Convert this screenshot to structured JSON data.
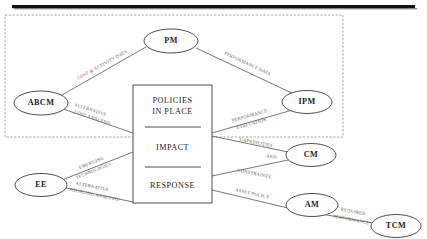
{
  "figure": {
    "type": "block-flow-diagram",
    "top_rule": {
      "present": true,
      "color": "#121212"
    },
    "boundary": {
      "name": "dashed-boundary-region",
      "style": "dashed",
      "color": "#8a8a8a",
      "x": 5,
      "y": 15,
      "width": 338,
      "height": 122
    }
  },
  "center_box": {
    "name": "policies-impact-response-box",
    "x": 133,
    "y": 85,
    "width": 79,
    "height": 118,
    "sections": [
      {
        "label": "POLICIES",
        "label2": "IN PLACE"
      },
      {
        "label": "IMPACT"
      },
      {
        "label": "RESPONSE"
      }
    ],
    "line1": "POLICIES",
    "line2": "IN PLACE",
    "line3": "IMPACT",
    "line4": "RESPONSE"
  },
  "nodes": [
    {
      "id": "PM",
      "label": "PM",
      "cx": 171,
      "cy": 41,
      "rx": 27,
      "ry": 12
    },
    {
      "id": "ABCM",
      "label": "ABCM",
      "cx": 41,
      "cy": 103,
      "rx": 27,
      "ry": 12
    },
    {
      "id": "IPM",
      "label": "IPM",
      "cx": 307,
      "cy": 102,
      "rx": 25,
      "ry": 11.5
    },
    {
      "id": "CM",
      "label": "CM",
      "cx": 311,
      "cy": 155,
      "rx": 25,
      "ry": 11.5
    },
    {
      "id": "EE",
      "label": "EE",
      "cx": 41,
      "cy": 185,
      "rx": 26,
      "ry": 11.5
    },
    {
      "id": "AM",
      "label": "AM",
      "cx": 312,
      "cy": 205,
      "rx": 26,
      "ry": 11.5
    },
    {
      "id": "TCM",
      "label": "TCM",
      "cx": 396,
      "cy": 226,
      "rx": 25,
      "ry": 11.5
    }
  ],
  "edges": [
    {
      "id": "abcm-pm",
      "from": "ABCM",
      "to": "PM",
      "label": "COST & ACTIVITY DATA",
      "label_x": 103,
      "label_y": 66,
      "label_rotate": -27
    },
    {
      "id": "pm-ipm",
      "from": "PM",
      "to": "IPM",
      "label": "PERFORMANCE DATA",
      "label_x": 247,
      "label_y": 65,
      "label_rotate": 31
    },
    {
      "id": "abcm-box",
      "from": "ABCM",
      "to": "center_box",
      "label_line1": "ALTERNATIVE",
      "label_line2": "COST ANALYSIS",
      "label_x": 88,
      "label_y": 112,
      "label_rotate": 13
    },
    {
      "id": "ipm-box",
      "from": "IPM",
      "to": "center_box",
      "label_line1": "PERFORMANCE",
      "label_line2": "EVALUATION",
      "label_x": 252,
      "label_y": 115,
      "label_rotate": -31
    },
    {
      "id": "box-cm",
      "from": "center_box",
      "to": "CM",
      "label": "CAPABILITIES",
      "label_x": 255,
      "label_y": 144,
      "label_rotate": -11
    },
    {
      "id": "box-cm-and",
      "label": "AND",
      "label_x": 268,
      "label_y": 158,
      "label_rotate": -11
    },
    {
      "id": "cm-box",
      "from": "CM",
      "to": "center_box",
      "label": "CONSTRAINTS",
      "label_x": 255,
      "label_y": 175,
      "label_rotate": -13
    },
    {
      "id": "ee-box-upper",
      "from": "EE",
      "to": "center_box",
      "label_line1": "EMERGING",
      "label_line2": "TECHNOLOGIES",
      "label_x": 90,
      "label_y": 167,
      "label_rotate": -22
    },
    {
      "id": "ee-box-lower",
      "from": "EE",
      "to": "center_box",
      "label_line1": "ALTERNATIVE",
      "label_line2": "SOURCING ANALYSIS",
      "label_x": 92,
      "label_y": 190,
      "label_rotate": 10
    },
    {
      "id": "box-am",
      "from": "center_box",
      "to": "AM",
      "label": "ASSET POLICY",
      "label_x": 252,
      "label_y": 196,
      "label_rotate": 12
    },
    {
      "id": "tcm-am",
      "from": "TCM",
      "to": "AM",
      "label_line1": "REQUIRED",
      "label_line2": "PERFORMANCE",
      "label_x": 351,
      "label_y": 215,
      "label_rotate": 11
    }
  ]
}
